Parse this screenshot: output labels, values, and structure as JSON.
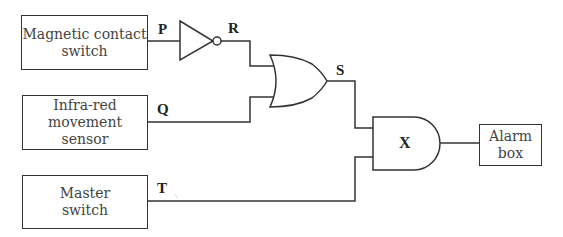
{
  "diagram": {
    "type": "logic-circuit",
    "inputs": [
      {
        "id": "magnetic",
        "lines": [
          "Magnetic contact",
          "switch"
        ],
        "signal": "P"
      },
      {
        "id": "infrared",
        "lines": [
          "Infra-red",
          "movement sensor"
        ],
        "signal": "Q"
      },
      {
        "id": "master",
        "lines": [
          "Master",
          "switch"
        ],
        "signal": "T"
      }
    ],
    "gates": [
      {
        "id": "not",
        "kind": "NOT",
        "input": "P",
        "output": "R"
      },
      {
        "id": "or",
        "kind": "OR",
        "inputs": [
          "R",
          "Q"
        ],
        "output": "S"
      },
      {
        "id": "and",
        "kind": "AND",
        "inputs": [
          "S",
          "T"
        ],
        "output": "X",
        "label": "X"
      }
    ],
    "output": {
      "id": "alarm",
      "lines": [
        "Alarm",
        "box"
      ]
    },
    "signal_labels": {
      "P": "P",
      "Q": "Q",
      "R": "R",
      "S": "S",
      "T": "T",
      "X": "X"
    },
    "stray_mark": "\\",
    "colors": {
      "line": "#333333",
      "text": "#444444",
      "label": "#222222",
      "background": "#ffffff"
    }
  }
}
